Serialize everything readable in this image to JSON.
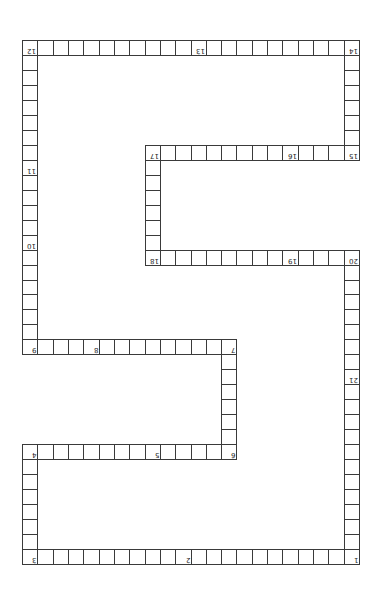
{
  "puzzle": {
    "type": "snake-path-grid",
    "orientation": "rotated-180",
    "grid": {
      "cols": 22,
      "rows": 35,
      "origin_x": 22,
      "origin_y": 40,
      "cell_w": 15.32,
      "cell_h": 14.97
    },
    "colors": {
      "line": "#3a3a3a",
      "cell_bg": "#ffffff",
      "number": "#222222"
    },
    "segments": [
      {
        "name": "top-row",
        "from": [
          0,
          0
        ],
        "to": [
          0,
          21
        ]
      },
      {
        "name": "right-upper-col",
        "from": [
          0,
          21
        ],
        "to": [
          7,
          21
        ]
      },
      {
        "name": "row-15-17",
        "from": [
          7,
          8
        ],
        "to": [
          7,
          21
        ]
      },
      {
        "name": "col-17-18",
        "from": [
          7,
          8
        ],
        "to": [
          14,
          8
        ]
      },
      {
        "name": "row-18-20",
        "from": [
          14,
          8
        ],
        "to": [
          14,
          21
        ]
      },
      {
        "name": "right-lower-col",
        "from": [
          14,
          21
        ],
        "to": [
          34,
          21
        ]
      },
      {
        "name": "bottom-row",
        "from": [
          34,
          0
        ],
        "to": [
          34,
          21
        ]
      },
      {
        "name": "left-lower-col",
        "from": [
          27,
          0
        ],
        "to": [
          34,
          0
        ]
      },
      {
        "name": "row-4-6",
        "from": [
          27,
          0
        ],
        "to": [
          27,
          13
        ]
      },
      {
        "name": "col-6-7",
        "from": [
          20,
          13
        ],
        "to": [
          27,
          13
        ]
      },
      {
        "name": "row-7-9",
        "from": [
          20,
          0
        ],
        "to": [
          20,
          13
        ]
      },
      {
        "name": "left-upper-col",
        "from": [
          0,
          0
        ],
        "to": [
          20,
          0
        ]
      }
    ],
    "numbers": [
      {
        "label": "1",
        "row": 34,
        "col": 21
      },
      {
        "label": "2",
        "row": 34,
        "col": 10
      },
      {
        "label": "3",
        "row": 34,
        "col": 0
      },
      {
        "label": "4",
        "row": 27,
        "col": 0
      },
      {
        "label": "5",
        "row": 27,
        "col": 8
      },
      {
        "label": "6",
        "row": 27,
        "col": 13
      },
      {
        "label": "7",
        "row": 20,
        "col": 13
      },
      {
        "label": "8",
        "row": 20,
        "col": 4
      },
      {
        "label": "9",
        "row": 20,
        "col": 0
      },
      {
        "label": "10",
        "row": 13,
        "col": 0
      },
      {
        "label": "11",
        "row": 8,
        "col": 0
      },
      {
        "label": "12",
        "row": 0,
        "col": 0
      },
      {
        "label": "13",
        "row": 0,
        "col": 11
      },
      {
        "label": "14",
        "row": 0,
        "col": 21
      },
      {
        "label": "15",
        "row": 7,
        "col": 21
      },
      {
        "label": "16",
        "row": 7,
        "col": 17
      },
      {
        "label": "17",
        "row": 7,
        "col": 8
      },
      {
        "label": "18",
        "row": 14,
        "col": 8
      },
      {
        "label": "19",
        "row": 14,
        "col": 17
      },
      {
        "label": "20",
        "row": 14,
        "col": 21
      },
      {
        "label": "21",
        "row": 22,
        "col": 21
      }
    ]
  }
}
